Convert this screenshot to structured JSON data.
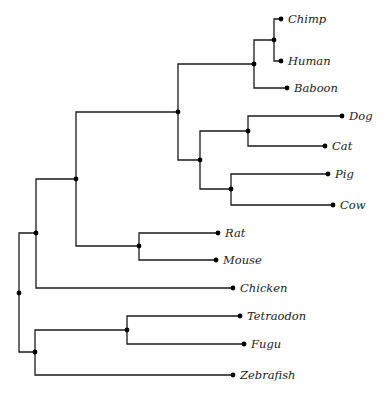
{
  "diagram": {
    "type": "phylogenetic-tree",
    "line_color": "#1a1a1a",
    "nodes": [
      {
        "id": "root",
        "x": 19,
        "y": 293
      },
      {
        "id": "n_land",
        "x": 36,
        "y": 233
      },
      {
        "id": "n_mammals",
        "x": 76,
        "y": 179
      },
      {
        "id": "n_upper",
        "x": 178,
        "y": 112
      },
      {
        "id": "n_primates",
        "x": 254,
        "y": 64
      },
      {
        "id": "n_chimp_human",
        "x": 274,
        "y": 40
      },
      {
        "id": "n_laurasia",
        "x": 200,
        "y": 160
      },
      {
        "id": "n_carnivores",
        "x": 248,
        "y": 131
      },
      {
        "id": "n_ungulates",
        "x": 231,
        "y": 189
      },
      {
        "id": "n_rodents",
        "x": 139,
        "y": 246
      },
      {
        "id": "n_fish",
        "x": 35,
        "y": 352
      },
      {
        "id": "n_puffer",
        "x": 127,
        "y": 330
      }
    ],
    "edges": [
      {
        "from": "root",
        "to": "n_land"
      },
      {
        "from": "root",
        "to": "n_fish"
      },
      {
        "from": "n_land",
        "to": "n_mammals"
      },
      {
        "from": "n_land",
        "to": "Chicken"
      },
      {
        "from": "n_mammals",
        "to": "n_upper"
      },
      {
        "from": "n_mammals",
        "to": "n_rodents"
      },
      {
        "from": "n_upper",
        "to": "n_primates"
      },
      {
        "from": "n_upper",
        "to": "n_laurasia"
      },
      {
        "from": "n_primates",
        "to": "n_chimp_human"
      },
      {
        "from": "n_primates",
        "to": "Baboon"
      },
      {
        "from": "n_chimp_human",
        "to": "Chimp"
      },
      {
        "from": "n_chimp_human",
        "to": "Human"
      },
      {
        "from": "n_laurasia",
        "to": "n_carnivores"
      },
      {
        "from": "n_laurasia",
        "to": "n_ungulates"
      },
      {
        "from": "n_carnivores",
        "to": "Dog"
      },
      {
        "from": "n_carnivores",
        "to": "Cat"
      },
      {
        "from": "n_ungulates",
        "to": "Pig"
      },
      {
        "from": "n_ungulates",
        "to": "Cow"
      },
      {
        "from": "n_rodents",
        "to": "Rat"
      },
      {
        "from": "n_rodents",
        "to": "Mouse"
      },
      {
        "from": "n_fish",
        "to": "n_puffer"
      },
      {
        "from": "n_fish",
        "to": "Zebrafish"
      },
      {
        "from": "n_puffer",
        "to": "Tetraodon"
      },
      {
        "from": "n_puffer",
        "to": "Fugu"
      }
    ],
    "leaves": [
      {
        "id": "Chimp",
        "label": "Chimp",
        "x": 281,
        "y": 19
      },
      {
        "id": "Human",
        "label": "Human",
        "x": 281,
        "y": 61
      },
      {
        "id": "Baboon",
        "label": "Baboon",
        "x": 287,
        "y": 88
      },
      {
        "id": "Dog",
        "label": "Dog",
        "x": 342,
        "y": 116
      },
      {
        "id": "Cat",
        "label": "Cat",
        "x": 325,
        "y": 146
      },
      {
        "id": "Pig",
        "label": "Pig",
        "x": 328,
        "y": 174
      },
      {
        "id": "Cow",
        "label": "Cow",
        "x": 333,
        "y": 205
      },
      {
        "id": "Rat",
        "label": "Rat",
        "x": 218,
        "y": 233
      },
      {
        "id": "Mouse",
        "label": "Mouse",
        "x": 216,
        "y": 260
      },
      {
        "id": "Chicken",
        "label": "Chicken",
        "x": 233,
        "y": 288
      },
      {
        "id": "Tetraodon",
        "label": "Tetraodon",
        "x": 240,
        "y": 316
      },
      {
        "id": "Fugu",
        "label": "Fugu",
        "x": 244,
        "y": 344
      },
      {
        "id": "Zebrafish",
        "label": "Zebrafish",
        "x": 233,
        "y": 375
      }
    ]
  }
}
